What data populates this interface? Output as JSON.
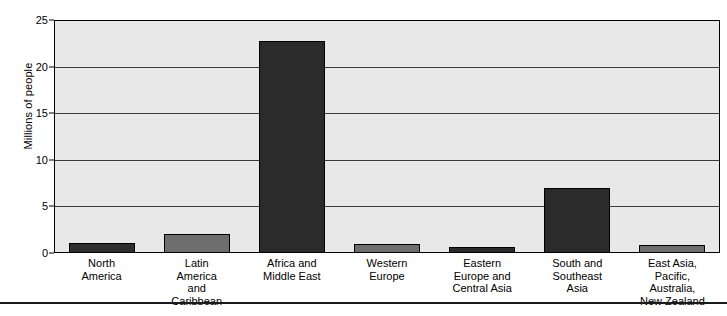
{
  "chart_data": {
    "type": "bar",
    "title": "",
    "xlabel": "",
    "ylabel": "Millions of people",
    "ylim": [
      0,
      25
    ],
    "yticks": [
      0,
      5,
      10,
      15,
      20,
      25
    ],
    "grid": "horizontal",
    "legend": "none",
    "categories": [
      "North\nAmerica",
      "Latin\nAmerica\nand\nCaribbean",
      "Africa and\nMiddle East",
      "Western\nEurope",
      "Eastern\nEurope and\nCentral Asia",
      "South and\nSoutheast\nAsia",
      "East Asia,\nPacific,\nAustralia,\nNew Zealand"
    ],
    "values": [
      1.1,
      2.0,
      22.8,
      1.0,
      0.6,
      7.0,
      0.9
    ],
    "bar_colors": [
      "#2e2e2e",
      "#6e6e6e",
      "#2b2b2b",
      "#6e6e6e",
      "#2b2b2b",
      "#2b2b2b",
      "#6e6e6e"
    ]
  },
  "axis": {
    "y_title": "Millions of people",
    "y_tick_labels": [
      "0",
      "5",
      "10",
      "15",
      "20",
      "25"
    ]
  },
  "categories": [
    {
      "lines": [
        "North",
        "America"
      ]
    },
    {
      "lines": [
        "Latin",
        "America",
        "and",
        "Caribbean"
      ]
    },
    {
      "lines": [
        "Africa and",
        "Middle East"
      ]
    },
    {
      "lines": [
        "Western",
        "Europe"
      ]
    },
    {
      "lines": [
        "Eastern",
        "Europe and",
        "Central Asia"
      ]
    },
    {
      "lines": [
        "South and",
        "Southeast",
        "Asia"
      ]
    },
    {
      "lines": [
        "East Asia,",
        "Pacific,",
        "Australia,",
        "New Zealand"
      ]
    }
  ],
  "colors": {
    "plot_background": "#e8e8e8",
    "axis_line": "#000000",
    "gridline": "#3a3a3a",
    "bar_dark": "#2b2b2b",
    "bar_medium": "#6e6e6e",
    "page_background": "#ffffff"
  }
}
